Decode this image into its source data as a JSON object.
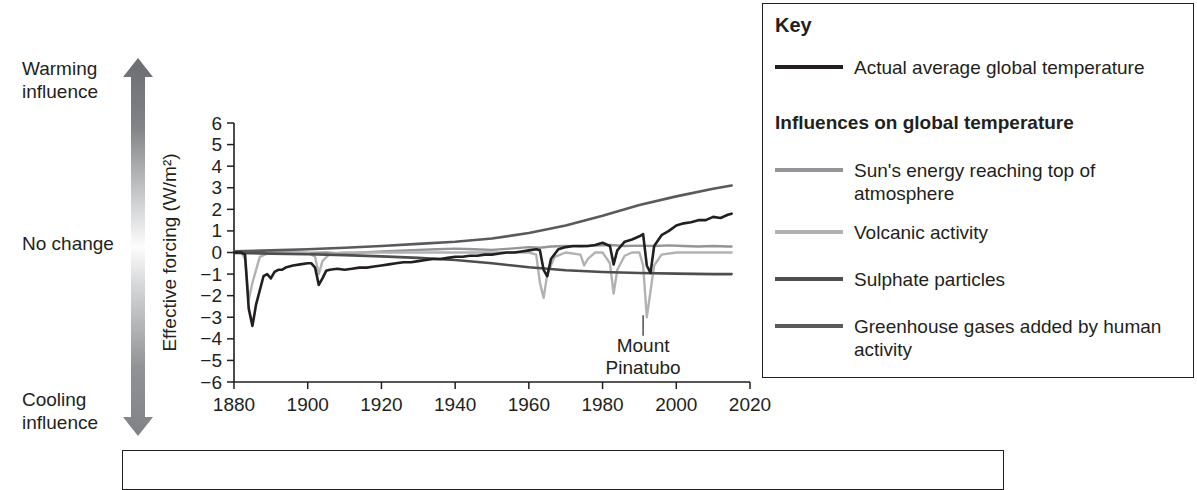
{
  "influence_scale": {
    "top_label": "Warming\ninfluence",
    "middle_label": "No change",
    "bottom_label": "Cooling\ninfluence",
    "arrow_top_color": "#6d6e71",
    "arrow_middle_color": "#ffffff",
    "arrow_bottom_color": "#808285"
  },
  "key": {
    "title": "Key",
    "subtitle": "Influences on global temperature",
    "actual": {
      "label": "Actual average global temperature",
      "color": "#231f20"
    },
    "items": [
      {
        "label": "Sun's energy reaching top of atmosphere",
        "color": "#939598"
      },
      {
        "label": "Volcanic activity",
        "color": "#b0b2b4"
      },
      {
        "label": "Sulphate particles",
        "color": "#4d4e50"
      },
      {
        "label": "Greenhouse gases added by human activity",
        "color": "#595a5c"
      }
    ]
  },
  "chart_data": {
    "type": "line",
    "title": "",
    "xlabel": "",
    "ylabel": "Effective forcing (W/m²)",
    "xlim": [
      1880,
      2020
    ],
    "ylim": [
      -6,
      6
    ],
    "xticks": [
      1880,
      1900,
      1920,
      1940,
      1960,
      1980,
      2000,
      2020
    ],
    "yticks": [
      6,
      5,
      4,
      3,
      2,
      1,
      0,
      -1,
      -2,
      -3,
      -4,
      -5,
      -6
    ],
    "ytick_labels": [
      "6",
      "5",
      "4",
      "3",
      "2",
      "1",
      "0",
      "−1",
      "−2",
      "−3",
      "−4",
      "−5",
      "−6"
    ],
    "grid": false,
    "legend_position": "right-outside-box",
    "annotations": [
      {
        "text": "Mount\nPinatubo",
        "x": 1991,
        "y": -3.0,
        "label_y": -4.6
      }
    ],
    "series": [
      {
        "name": "Actual average global temperature",
        "color": "#231f20",
        "width": 2.6,
        "x": [
          1880,
          1882,
          1883,
          1884,
          1885,
          1886,
          1888,
          1889,
          1890,
          1891,
          1892,
          1893,
          1894,
          1896,
          1898,
          1900,
          1901,
          1902,
          1903,
          1904,
          1905,
          1906,
          1908,
          1910,
          1912,
          1914,
          1916,
          1918,
          1920,
          1922,
          1924,
          1926,
          1928,
          1930,
          1932,
          1934,
          1936,
          1938,
          1940,
          1942,
          1944,
          1946,
          1948,
          1950,
          1952,
          1954,
          1956,
          1958,
          1960,
          1962,
          1963,
          1964,
          1965,
          1966,
          1968,
          1970,
          1972,
          1974,
          1976,
          1978,
          1980,
          1982,
          1983,
          1984,
          1986,
          1988,
          1990,
          1991,
          1992,
          1993,
          1994,
          1996,
          1998,
          2000,
          2002,
          2004,
          2006,
          2008,
          2010,
          2012,
          2014,
          2015
        ],
        "y": [
          0.0,
          0.0,
          -0.1,
          -2.6,
          -3.4,
          -2.4,
          -1.1,
          -1.0,
          -1.2,
          -0.9,
          -0.8,
          -0.8,
          -0.7,
          -0.6,
          -0.55,
          -0.5,
          -0.5,
          -0.7,
          -1.5,
          -1.2,
          -0.85,
          -0.8,
          -0.75,
          -0.8,
          -0.75,
          -0.7,
          -0.7,
          -0.65,
          -0.6,
          -0.55,
          -0.5,
          -0.45,
          -0.45,
          -0.4,
          -0.35,
          -0.3,
          -0.3,
          -0.25,
          -0.2,
          -0.2,
          -0.15,
          -0.15,
          -0.1,
          -0.1,
          -0.05,
          0.0,
          0.0,
          0.05,
          0.1,
          0.15,
          0.1,
          -0.8,
          -1.1,
          -0.3,
          0.15,
          0.25,
          0.3,
          0.3,
          0.3,
          0.35,
          0.45,
          0.3,
          -0.55,
          0.1,
          0.5,
          0.6,
          0.75,
          0.85,
          -0.6,
          -0.95,
          0.3,
          0.8,
          1.0,
          1.25,
          1.35,
          1.4,
          1.5,
          1.5,
          1.65,
          1.6,
          1.75,
          1.8
        ]
      },
      {
        "name": "Greenhouse gases added by human activity",
        "color": "#595a5c",
        "width": 2.6,
        "x": [
          1880,
          1890,
          1900,
          1910,
          1920,
          1930,
          1940,
          1950,
          1960,
          1970,
          1980,
          1990,
          2000,
          2010,
          2015
        ],
        "y": [
          0.05,
          0.1,
          0.15,
          0.22,
          0.3,
          0.4,
          0.5,
          0.65,
          0.9,
          1.25,
          1.7,
          2.2,
          2.6,
          2.95,
          3.1
        ]
      },
      {
        "name": "Sulphate particles",
        "color": "#4d4e50",
        "width": 2.6,
        "x": [
          1880,
          1890,
          1900,
          1910,
          1920,
          1930,
          1940,
          1950,
          1960,
          1970,
          1980,
          1990,
          2000,
          2010,
          2015
        ],
        "y": [
          -0.02,
          -0.05,
          -0.08,
          -0.12,
          -0.18,
          -0.25,
          -0.35,
          -0.5,
          -0.68,
          -0.82,
          -0.9,
          -0.95,
          -0.98,
          -1.0,
          -1.0
        ]
      },
      {
        "name": "Sun's energy reaching top of atmosphere",
        "color": "#939598",
        "width": 2.4,
        "x": [
          1880,
          1885,
          1890,
          1895,
          1900,
          1905,
          1910,
          1915,
          1920,
          1925,
          1930,
          1935,
          1940,
          1945,
          1950,
          1955,
          1960,
          1963,
          1966,
          1970,
          1974,
          1978,
          1982,
          1986,
          1990,
          1994,
          1998,
          2002,
          2006,
          2010,
          2014,
          2015
        ],
        "y": [
          0.0,
          -0.03,
          -0.02,
          0.0,
          -0.02,
          0.0,
          -0.05,
          0.0,
          0.05,
          0.08,
          0.12,
          0.15,
          0.18,
          0.15,
          0.12,
          0.18,
          0.25,
          0.22,
          0.28,
          0.3,
          0.28,
          0.32,
          0.35,
          0.3,
          0.32,
          0.3,
          0.33,
          0.3,
          0.28,
          0.3,
          0.28,
          0.28
        ]
      },
      {
        "name": "Volcanic activity",
        "color": "#b0b2b4",
        "width": 2.4,
        "x": [
          1880,
          1882,
          1883,
          1884,
          1885,
          1887,
          1889,
          1890,
          1892,
          1895,
          1900,
          1902,
          1903,
          1904,
          1906,
          1910,
          1915,
          1920,
          1925,
          1930,
          1935,
          1940,
          1945,
          1950,
          1955,
          1960,
          1962,
          1963,
          1964,
          1965,
          1967,
          1970,
          1974,
          1975,
          1976,
          1978,
          1980,
          1982,
          1983,
          1984,
          1986,
          1988,
          1990,
          1991,
          1992,
          1993,
          1994,
          1996,
          2000,
          2004,
          2008,
          2012,
          2015
        ],
        "y": [
          0.0,
          0.0,
          -0.3,
          -2.2,
          -1.4,
          -0.2,
          -0.05,
          0.0,
          0.0,
          0.0,
          0.0,
          -0.2,
          -1.0,
          -0.4,
          -0.05,
          0.0,
          0.0,
          0.0,
          0.0,
          0.0,
          0.0,
          0.0,
          0.0,
          0.0,
          0.0,
          0.0,
          -0.1,
          -1.4,
          -2.1,
          -1.0,
          -0.2,
          0.0,
          -0.1,
          -0.6,
          -0.3,
          0.0,
          0.0,
          -0.5,
          -1.9,
          -0.8,
          -0.15,
          0.0,
          0.0,
          -0.6,
          -3.0,
          -1.8,
          -0.6,
          -0.1,
          0.0,
          0.0,
          0.0,
          0.0,
          0.0
        ]
      }
    ]
  }
}
